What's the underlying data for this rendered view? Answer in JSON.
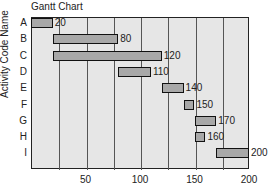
{
  "chart_data": {
    "type": "gantt",
    "title": "Gantt Chart",
    "xlabel": "Hours",
    "ylabel": "Activity Code Name",
    "xlim": [
      0,
      200
    ],
    "xticks": [
      50,
      100,
      150,
      200
    ],
    "gridlines": [
      25,
      50,
      75,
      100,
      125,
      150,
      175
    ],
    "categories": [
      "A",
      "B",
      "C",
      "D",
      "E",
      "F",
      "G",
      "H",
      "I"
    ],
    "tasks": [
      {
        "name": "A",
        "start": 0,
        "end": 20,
        "label": "20"
      },
      {
        "name": "B",
        "start": 20,
        "end": 80,
        "label": "80"
      },
      {
        "name": "C",
        "start": 20,
        "end": 120,
        "label": "120"
      },
      {
        "name": "D",
        "start": 80,
        "end": 110,
        "label": "110"
      },
      {
        "name": "E",
        "start": 120,
        "end": 140,
        "label": "140"
      },
      {
        "name": "F",
        "start": 140,
        "end": 150,
        "label": "150"
      },
      {
        "name": "G",
        "start": 150,
        "end": 170,
        "label": "170"
      },
      {
        "name": "H",
        "start": 150,
        "end": 160,
        "label": "160"
      },
      {
        "name": "I",
        "start": 170,
        "end": 200,
        "label": "200"
      }
    ],
    "colors": {
      "bar": "#a8a8a8",
      "plot_bg": "#e6e6e6",
      "border": "#111111"
    }
  }
}
